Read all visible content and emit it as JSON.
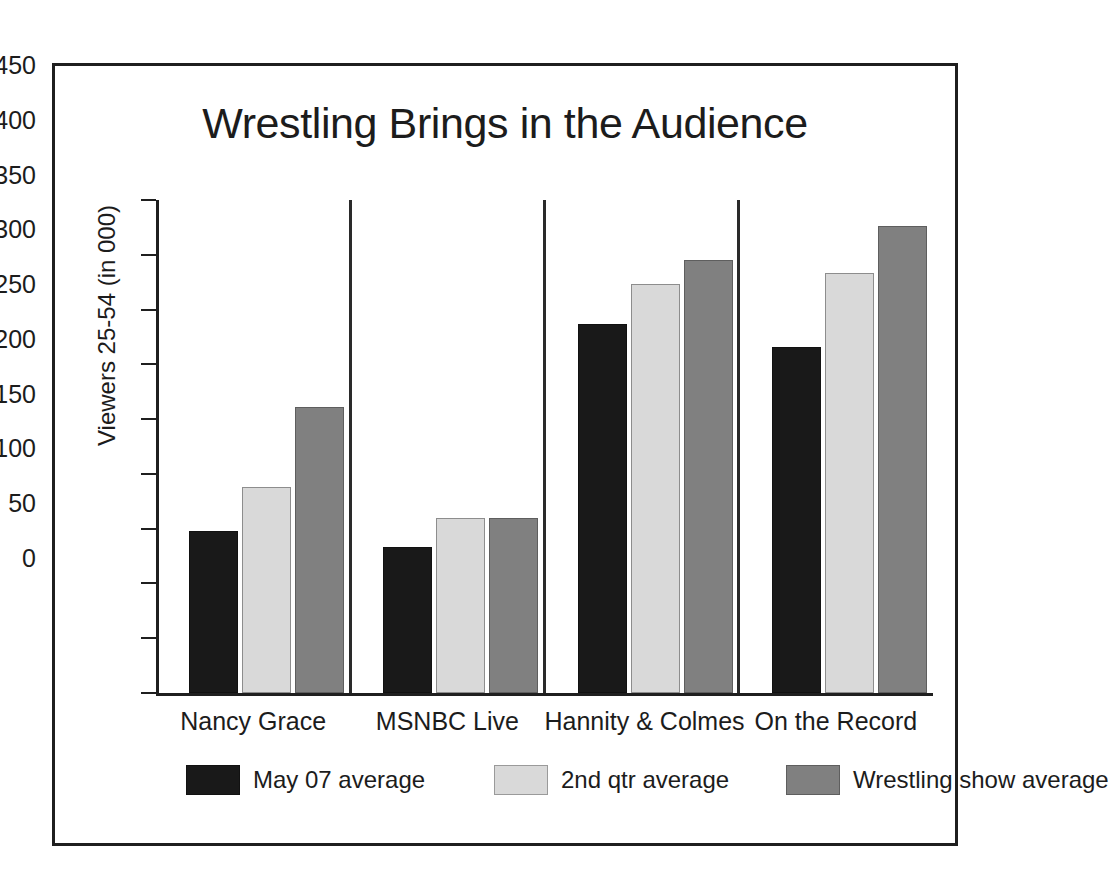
{
  "chart_data": {
    "type": "bar",
    "title": "Wrestling Brings in the Audience",
    "xlabel": "",
    "ylabel": "Viewers 25-54 (in 000)",
    "categories": [
      "Nancy Grace",
      "MSNBC Live",
      "Hannity & Colmes",
      "On the Record"
    ],
    "series": [
      {
        "name": "May 07 average",
        "color": "#191919",
        "values": [
          148,
          133,
          337,
          316
        ]
      },
      {
        "name": "2nd qtr average",
        "color": "#d9d9d9",
        "values": [
          188,
          160,
          373,
          383
        ]
      },
      {
        "name": "Wrestling show average",
        "color": "#808080",
        "values": [
          261,
          160,
          395,
          426
        ]
      }
    ],
    "ylim": [
      0,
      450
    ],
    "yticks": [
      0,
      50,
      100,
      150,
      200,
      250,
      300,
      350,
      400,
      450
    ],
    "ytick_labels": [
      "0",
      "50",
      "100",
      "150",
      "200",
      "250",
      "300",
      "350",
      "400",
      "450"
    ],
    "grid": false,
    "group_separators": true,
    "legend_position": "bottom"
  },
  "legend": {
    "items": [
      {
        "label": "May 07 average",
        "swatch": "black-swatch"
      },
      {
        "label": "2nd qtr average",
        "swatch": "light-gray-swatch"
      },
      {
        "label": "Wrestling show average",
        "swatch": "dark-gray-swatch"
      }
    ]
  },
  "colors": {
    "series_1": "#191919",
    "series_2": "#d9d9d9",
    "series_3": "#808080",
    "axis": "#1f1f1f",
    "frame": "#1f1f1f",
    "text": "#1c1c1c",
    "background": "#ffffff"
  }
}
